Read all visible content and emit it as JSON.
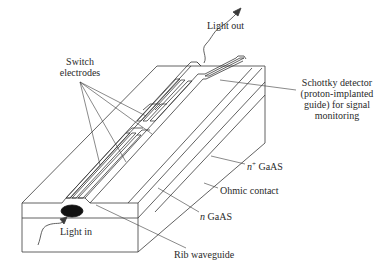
{
  "diagram": {
    "labels": {
      "light_out": "Light out",
      "switch_electrodes_line1": "Switch",
      "switch_electrodes_line2": "electrodes",
      "schottky_line1": "Schottky detector",
      "schottky_line2": "(proton-implanted",
      "schottky_line3": "guide) for signal",
      "schottky_line4": "monitoring",
      "n_plus_prefix": "n",
      "n_plus_sup": "+",
      "n_plus_material": " GaAS",
      "ohmic_contact": "Ohmic contact",
      "n_prefix": "n",
      "n_material": " GaAS",
      "light_in": "Light in",
      "rib_waveguide": "Rib waveguide"
    },
    "colors": {
      "line": "#3a3a3a",
      "text": "#2a2a2a",
      "spot": "#111111",
      "background": "#ffffff"
    }
  }
}
